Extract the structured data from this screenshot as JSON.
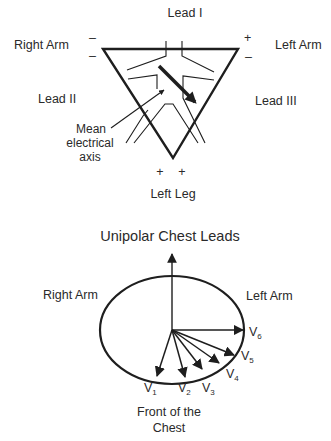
{
  "limb_leads": {
    "lead_i": "Lead I",
    "lead_ii": "Lead II",
    "lead_iii": "Lead III",
    "right_arm": "Right Arm",
    "left_arm": "Left Arm",
    "left_leg": "Left Leg",
    "mean_axis": [
      "Mean",
      "electrical",
      "axis"
    ],
    "signs": {
      "right_arm_top": "–",
      "right_arm_bottom": "–",
      "left_arm_top": "+",
      "left_arm_bottom": "–",
      "left_leg_1": "+",
      "left_leg_2": "+"
    }
  },
  "chest_leads": {
    "title": "Unipolar Chest Leads",
    "right_arm": "Right Arm",
    "left_arm": "Left Arm",
    "front": [
      "Front of the",
      "Chest"
    ],
    "leads": [
      {
        "name": "V",
        "sub": "1"
      },
      {
        "name": "V",
        "sub": "2"
      },
      {
        "name": "V",
        "sub": "3"
      },
      {
        "name": "V",
        "sub": "4"
      },
      {
        "name": "V",
        "sub": "5"
      },
      {
        "name": "V",
        "sub": "6"
      }
    ]
  },
  "colors": {
    "line": "#1e1e1e",
    "text": "#2a2a2a",
    "background": "#ffffff"
  }
}
